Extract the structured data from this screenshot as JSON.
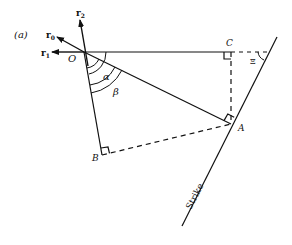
{
  "figure": {
    "panel_label": "(a)",
    "points": {
      "O": "O",
      "A": "A",
      "B": "B",
      "C": "C"
    },
    "angles": {
      "alpha": "α",
      "beta": "β",
      "dip_symbol": "Ξ"
    },
    "vectors": {
      "r0": {
        "base": "r",
        "sub": "0"
      },
      "r1": {
        "base": "r",
        "sub": "1"
      },
      "r2": {
        "base": "r",
        "sub": "2"
      }
    },
    "strike_label": "Strike",
    "colors": {
      "ink": "#111111",
      "background": "#ffffff"
    }
  }
}
